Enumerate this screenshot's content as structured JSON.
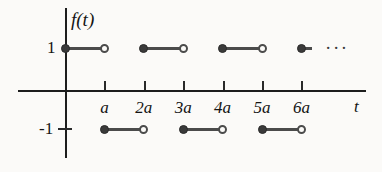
{
  "figure": {
    "title": "f(t)",
    "background_color": "#fbfaf8",
    "axis_color": "#1d1d1d",
    "curve_color": "#4b4b4b",
    "marker_fill_color": "#3a3a3a"
  },
  "axes": {
    "y_axis_label": "f(t)",
    "x_axis_label": "t",
    "y_tick_labels": [
      "1",
      "-1"
    ],
    "x_tick_labels": [
      "a",
      "2a",
      "3a",
      "4a",
      "5a",
      "6a"
    ],
    "continuation_marker": "···"
  },
  "chart_data": {
    "type": "line",
    "title": "f(t)",
    "subtitle": "",
    "xlabel": "t",
    "ylabel": "f(t)",
    "grid": false,
    "legend": "none",
    "xlim": [
      -1.2,
      7.6
    ],
    "ylim": [
      -1.8,
      1.8
    ],
    "x_tick_values": [
      1,
      2,
      3,
      4,
      5,
      6
    ],
    "x_tick_labels": [
      "a",
      "2a",
      "3a",
      "4a",
      "5a",
      "6a"
    ],
    "y_tick_values": [
      1,
      -1
    ],
    "y_tick_labels": [
      "1",
      "-1"
    ],
    "period": "2a",
    "amplitude": 1,
    "annotations": [
      {
        "text": "···",
        "x": 6.55,
        "y": 1,
        "name": "continuation-ellipsis"
      }
    ],
    "series": [
      {
        "name": "f(t)",
        "segments": [
          {
            "x_start": 0,
            "x_end": 1,
            "y": 1,
            "left_endpoint": "closed",
            "right_endpoint": "open"
          },
          {
            "x_start": 1,
            "x_end": 2,
            "y": -1,
            "left_endpoint": "closed",
            "right_endpoint": "open"
          },
          {
            "x_start": 2,
            "x_end": 3,
            "y": 1,
            "left_endpoint": "closed",
            "right_endpoint": "open"
          },
          {
            "x_start": 3,
            "x_end": 4,
            "y": -1,
            "left_endpoint": "closed",
            "right_endpoint": "open"
          },
          {
            "x_start": 4,
            "x_end": 5,
            "y": 1,
            "left_endpoint": "closed",
            "right_endpoint": "open"
          },
          {
            "x_start": 5,
            "x_end": 6,
            "y": -1,
            "left_endpoint": "closed",
            "right_endpoint": "open"
          },
          {
            "x_start": 6,
            "x_end": 6.28,
            "y": 1,
            "left_endpoint": "closed",
            "right_endpoint": "none"
          }
        ]
      }
    ]
  },
  "geometry": {
    "origin_x": 65,
    "origin_y": 90,
    "unit_x": 39.4,
    "level_top_y": 47,
    "level_bottom_y": 128,
    "x_axis_start": 18,
    "x_axis_end": 366,
    "y_axis_top": 8,
    "y_axis_bottom": 158,
    "tick_height": 9,
    "dot_radius": 4.5
  }
}
